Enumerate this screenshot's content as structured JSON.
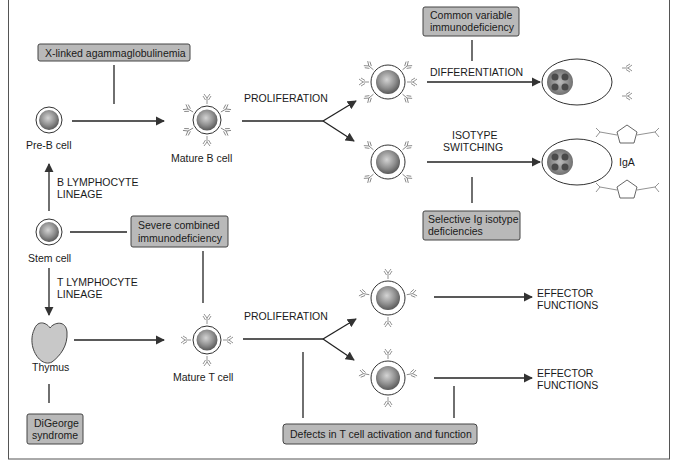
{
  "diagram": {
    "title": "",
    "cells": {
      "pre_b": "Pre-B cell",
      "mature_b": "Mature B cell",
      "stem": "Stem cell",
      "thymus": "Thymus",
      "mature_t": "Mature T cell",
      "iga": "IgA"
    },
    "processes": {
      "b_lineage_1": "B LYMPHOCYTE",
      "b_lineage_2": "LINEAGE",
      "t_lineage_1": "T LYMPHOCYTE",
      "t_lineage_2": "LINEAGE",
      "b_proliferation": "PROLIFERATION",
      "t_proliferation": "PROLIFERATION",
      "differentiation": "DIFFERENTIATION",
      "isotype_1": "ISOTYPE",
      "isotype_2": "SWITCHING",
      "effector1_1": "EFFECTOR",
      "effector1_2": "FUNCTIONS",
      "effector2_1": "EFFECTOR",
      "effector2_2": "FUNCTIONS"
    },
    "diseases": {
      "xla": "X-linked agammaglobulinemia",
      "cvid_1": "Common variable",
      "cvid_2": "immunodeficiency",
      "selective_1": "Selective Ig isotype",
      "selective_2": "deficiencies",
      "scid_1": "Severe combined",
      "scid_2": "immunodeficiency",
      "digeorge_1": "DiGeorge",
      "digeorge_2": "syndrome",
      "t_defects": "Defects in T cell activation and function"
    },
    "colors": {
      "disease_box": "#b9b9b9",
      "nucleus": "#8a8a8a",
      "line": "#222222"
    }
  }
}
